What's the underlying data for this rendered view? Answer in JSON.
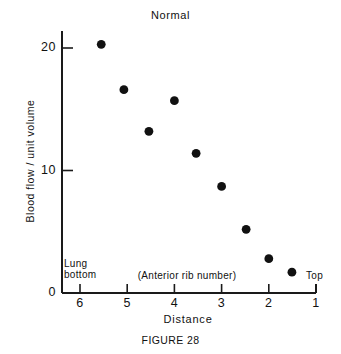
{
  "chart_data": {
    "type": "scatter",
    "title": "Normal",
    "xlabel": "Distance",
    "ylabel": "Blood flow / unit volume",
    "caption": "FIGURE 28",
    "xlim": [
      6.5,
      1.0
    ],
    "ylim": [
      0,
      21.5
    ],
    "x_ticks": [
      "6",
      "5",
      "4",
      "3",
      "2",
      "1"
    ],
    "x_tick_values": [
      6,
      5,
      4,
      3,
      2,
      1
    ],
    "y_ticks": [
      "0",
      "10",
      "20"
    ],
    "y_tick_values": [
      0,
      10,
      20
    ],
    "grid": false,
    "legend": "none",
    "x_axis_direction": "decreasing",
    "annotations": [
      {
        "id": "lung-bottom",
        "text": "Lung\nbottom",
        "line1": "Lung",
        "line2": "bottom"
      },
      {
        "id": "rib-number",
        "text": "(Anterior rib number)"
      },
      {
        "id": "top",
        "text": "Top"
      }
    ],
    "series": [
      {
        "name": "Normal",
        "marker": "filled-circle",
        "color": "#111111",
        "points": [
          {
            "x": 5.55,
            "y": 20.3
          },
          {
            "x": 5.07,
            "y": 16.6
          },
          {
            "x": 4.54,
            "y": 13.2
          },
          {
            "x": 4.0,
            "y": 15.7
          },
          {
            "x": 3.54,
            "y": 11.4
          },
          {
            "x": 3.0,
            "y": 8.7
          },
          {
            "x": 2.48,
            "y": 5.2
          },
          {
            "x": 2.0,
            "y": 2.8
          },
          {
            "x": 1.51,
            "y": 1.7
          }
        ]
      }
    ]
  },
  "colors": {
    "ink": "#111111",
    "axis": "#1a1a1a",
    "marker": "#111111",
    "background": "#ffffff"
  }
}
